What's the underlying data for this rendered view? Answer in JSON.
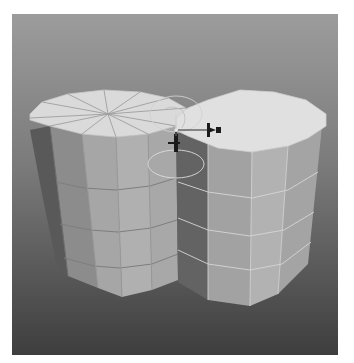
{
  "viewport": {
    "type": "3d-perspective-viewport",
    "scene": "two intersecting polygonal cylinders",
    "background_top": "#9a9a9a",
    "background_bottom": "#444444"
  },
  "objects": [
    {
      "name": "cylinder-left",
      "sides": 12,
      "height_segments": 4,
      "top_color": "#dcdcdc",
      "side_colors": [
        "#5a5a5a",
        "#8a8a8a",
        "#a4a4a4",
        "#b2b2b2"
      ],
      "state": "unselected"
    },
    {
      "name": "cylinder-right",
      "sides": 12,
      "height_segments": 4,
      "top_color": "#e0e0e0",
      "side_colors": [
        "#6a6a6a",
        "#9e9e9e",
        "#b0b0b0",
        "#a6a6a6"
      ],
      "state": "selected"
    }
  ],
  "manipulator": {
    "type": "move-rotate-gizmo",
    "handle_color": "#1a1a1a",
    "ring_color": "#d8d8d8"
  }
}
